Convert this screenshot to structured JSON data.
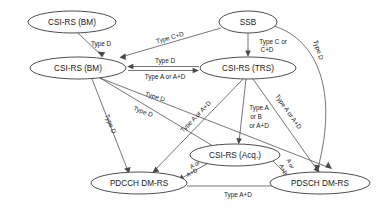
{
  "figure": {
    "type": "directed-graph"
  },
  "nodes": [
    {
      "id": "csirs_bm_top",
      "label": "CSI-RS (BM)",
      "cx": 72,
      "cy": 22,
      "rx": 44,
      "ry": 11
    },
    {
      "id": "csirs_bm",
      "label": "CSI-RS (BM)",
      "cx": 78,
      "cy": 68,
      "rx": 48,
      "ry": 11
    },
    {
      "id": "ssb",
      "label": "SSB",
      "cx": 248,
      "cy": 22,
      "rx": 29,
      "ry": 11
    },
    {
      "id": "csirs_trs",
      "label": "CSI-RS (TRS)",
      "cx": 248,
      "cy": 68,
      "rx": 48,
      "ry": 11
    },
    {
      "id": "csirs_acq",
      "label": "CSI-RS (Acq.)",
      "cx": 235,
      "cy": 155,
      "rx": 45,
      "ry": 11
    },
    {
      "id": "pdcch_dmrs",
      "label": "PDCCH DM-RS",
      "cx": 139,
      "cy": 183,
      "rx": 48,
      "ry": 11
    },
    {
      "id": "pdsch_dmrs",
      "label": "PDSCH DM-RS",
      "cx": 320,
      "cy": 183,
      "rx": 50,
      "ry": 11
    }
  ],
  "edge_labels": {
    "bm_to_bm": "Type D",
    "ssb_to_bm": "Type C+D",
    "ssb_to_trs": "Type C or\nC+D",
    "ssb_to_trs_l1": "Type C or",
    "ssb_to_trs_l2": "C+D",
    "trs_to_bm": "Type D",
    "bm_to_trs": "Type A or A+D",
    "ssb_to_pdsch": "Type D",
    "bm_to_acq": "Type D",
    "bm_to_pdcch": "Type D",
    "bm_to_pdsch": "Type D",
    "trs_to_pdcch": "Type A or A+D",
    "trs_to_acq_l1": "Type A",
    "trs_to_acq_l2": "or B",
    "trs_to_acq_l3": "or  A+D",
    "trs_to_pdsch": "Type A or A+D",
    "acq_to_pdcch_l1": "A or",
    "acq_to_pdcch_l2": "A+D",
    "acq_to_pdsch_l1": "A or",
    "acq_to_pdsch_l2": "A+D",
    "pdcch_to_pdsch": "Type  A+D"
  },
  "colors": {
    "background": "#ffffff",
    "stroke": "#4a4a4a",
    "node_stroke": "#3a3a3a",
    "text": "#1a1a1a"
  }
}
